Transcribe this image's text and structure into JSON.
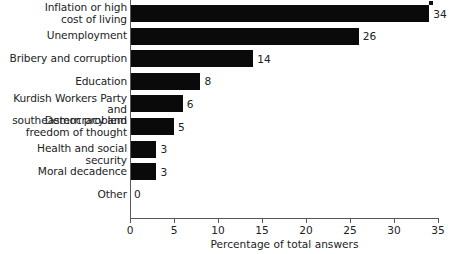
{
  "chart_data": {
    "type": "bar",
    "orientation": "horizontal",
    "title": "",
    "xlabel": "Percentage of total answers",
    "ylabel": "",
    "xlim": [
      0,
      35
    ],
    "xticks": [
      0,
      5,
      10,
      15,
      20,
      25,
      30,
      35
    ],
    "xtick_labels": [
      "0",
      "5",
      "10",
      "15",
      "20",
      "25",
      "30",
      "35"
    ],
    "grid": false,
    "legend": false,
    "bar_color": "#0a0a0a",
    "categories": [
      "Inflation or high\ncost of living",
      "Unemployment",
      "Bribery and corruption",
      "Education",
      "Kurdish Workers Party and\nsoutheastern problem",
      "Democracy and\nfreedom of thought",
      "Health and social security",
      "Moral decadence",
      "Other"
    ],
    "values": [
      34,
      26,
      14,
      8,
      6,
      5,
      3,
      3,
      0
    ],
    "value_labels": [
      "34",
      "26",
      "14",
      "8",
      "6",
      "5",
      "3",
      "3",
      "0"
    ]
  }
}
